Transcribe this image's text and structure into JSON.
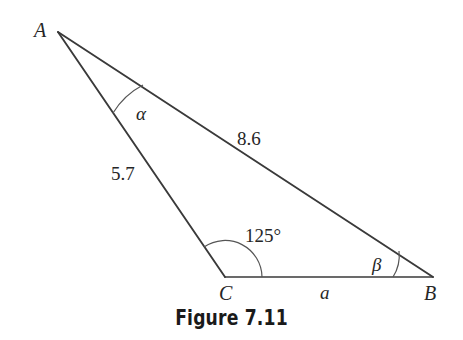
{
  "figure": {
    "caption": "Figure 7.11",
    "type": "triangle-diagram",
    "stroke_color": "#3a3a3a",
    "text_color": "#262626",
    "background_color": "#ffffff",
    "vertices": [
      {
        "name": "A",
        "label": "A",
        "x": 58,
        "y": 32
      },
      {
        "name": "C",
        "label": "C",
        "x": 225,
        "y": 277
      },
      {
        "name": "B",
        "label": "B",
        "x": 433,
        "y": 277
      }
    ],
    "sides": [
      {
        "name": "AB",
        "label": "8.6",
        "value": 8.6,
        "from": "A",
        "to": "B"
      },
      {
        "name": "AC",
        "label": "5.7",
        "value": 5.7,
        "from": "A",
        "to": "C"
      },
      {
        "name": "CB",
        "label": "a",
        "value": null,
        "from": "C",
        "to": "B"
      }
    ],
    "angles": [
      {
        "name": "alpha",
        "at": "A",
        "label": "α",
        "value": null
      },
      {
        "name": "gamma",
        "at": "C",
        "label": "125°",
        "value": 125
      },
      {
        "name": "beta",
        "at": "B",
        "label": "β",
        "value": null
      }
    ]
  }
}
